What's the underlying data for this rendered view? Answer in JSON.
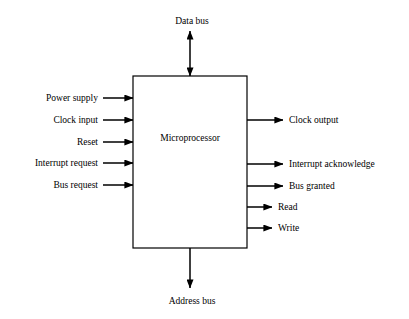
{
  "diagram": {
    "background_color": "#ffffff",
    "line_color": "#000000",
    "text_color": "#000000",
    "chip": {
      "label": "Microprocessor",
      "x": 133,
      "y": 76,
      "width": 114,
      "height": 172,
      "border_width": 1.2
    },
    "top_bus": {
      "label": "Data bus",
      "direction": "bidirectional",
      "label_x": 192,
      "label_y": 21,
      "line_x": 190,
      "line_top": 31,
      "line_bottom": 76
    },
    "bottom_bus": {
      "label": "Address bus",
      "direction": "down",
      "label_x": 192,
      "label_y": 301,
      "line_x": 190,
      "line_top": 248,
      "line_bottom": 288
    },
    "inputs": [
      {
        "label": "Power supply",
        "y": 98,
        "tail_x": 103
      },
      {
        "label": "Clock input",
        "y": 120,
        "tail_x": 103
      },
      {
        "label": "Reset",
        "y": 142,
        "tail_x": 103
      },
      {
        "label": "Interrupt request",
        "y": 163,
        "tail_x": 103
      },
      {
        "label": "Bus request",
        "y": 185,
        "tail_x": 103
      }
    ],
    "outputs": [
      {
        "label": "Clock output",
        "y": 120,
        "head_x": 283
      },
      {
        "label": "Interrupt acknowledge",
        "y": 164,
        "head_x": 283
      },
      {
        "label": "Bus granted",
        "y": 186,
        "head_x": 283
      },
      {
        "label": "Read",
        "y": 207,
        "head_x": 272
      },
      {
        "label": "Write",
        "y": 228,
        "head_x": 272
      }
    ]
  }
}
